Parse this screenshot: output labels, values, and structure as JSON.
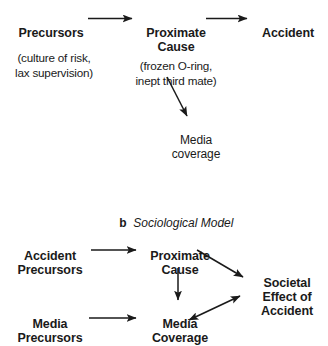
{
  "figure": {
    "panel_a": {
      "nodes": {
        "precursors": {
          "label": "Precursors",
          "detail": "(culture of risk,\nlax supervision)"
        },
        "proximate_cause": {
          "label": "Proximate\nCause",
          "detail": "(frozen O-ring,\ninept third mate)"
        },
        "accident": {
          "label": "Accident"
        },
        "media_coverage": {
          "label": "Media\ncoverage"
        }
      },
      "edges": [
        {
          "name": "precursors-to-proximate-cause",
          "from": "Precursors",
          "to": "Proximate Cause",
          "style": "single-arrow"
        },
        {
          "name": "proximate-cause-to-accident",
          "from": "Proximate Cause",
          "to": "Accident",
          "style": "single-arrow"
        },
        {
          "name": "proximate-cause-to-media-coverage",
          "from": "Proximate Cause",
          "to": "Media coverage",
          "style": "single-arrow"
        }
      ]
    },
    "panel_b": {
      "caption_letter": "b",
      "caption_text": "Sociological Model",
      "nodes": {
        "accident_precursors": {
          "label": "Accident\nPrecursors"
        },
        "proximate_cause": {
          "label": "Proximate\nCause"
        },
        "media_precursors": {
          "label": "Media\nPrecursors"
        },
        "media_coverage": {
          "label": "Media\nCoverage"
        },
        "societal_effect": {
          "label": "Societal\nEffect of\nAccident"
        }
      },
      "edges": [
        {
          "name": "accident-precursors-to-proximate-cause",
          "from": "Accident Precursors",
          "to": "Proximate Cause",
          "style": "single-arrow"
        },
        {
          "name": "media-precursors-to-media-coverage",
          "from": "Media Precursors",
          "to": "Media Coverage",
          "style": "single-arrow"
        },
        {
          "name": "proximate-cause-to-media-coverage",
          "from": "Proximate Cause",
          "to": "Media Coverage",
          "style": "single-arrow"
        },
        {
          "name": "proximate-cause-to-societal-effect",
          "from": "Proximate Cause",
          "to": "Societal Effect of Accident",
          "style": "single-arrow"
        },
        {
          "name": "media-coverage-societal-effect",
          "from": "Media Coverage",
          "to": "Societal Effect of Accident",
          "style": "double-arrow"
        }
      ]
    }
  },
  "colors": {
    "ink": "#1a1a1a",
    "background": "#ffffff"
  }
}
